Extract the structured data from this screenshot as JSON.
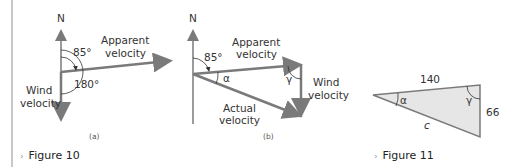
{
  "figure10": {
    "caption": "Figure 10",
    "panel_a": {
      "label": "(a)",
      "north": "N",
      "angle1": "85°",
      "angle2": "180°",
      "apparent_line1": "Apparent",
      "apparent_line2": "velocity",
      "wind_line1": "Wind",
      "wind_line2": "velocity"
    },
    "panel_b": {
      "label": "(b)",
      "north": "N",
      "angle1": "85°",
      "alpha": "α",
      "gamma": "γ",
      "apparent_line1": "Apparent",
      "apparent_line2": "velocity",
      "wind_line1": "Wind",
      "wind_line2": "velocity",
      "actual_line1": "Actual",
      "actual_line2": "velocity"
    }
  },
  "figure11": {
    "caption": "Figure 11",
    "side_top": "140",
    "side_right": "66",
    "side_c": "c",
    "alpha": "α",
    "gamma": "γ"
  },
  "colors": {
    "arrow": "#7a7a7a",
    "triangle_fill": "#e6e6e6",
    "divider": "#c8c8c8"
  }
}
